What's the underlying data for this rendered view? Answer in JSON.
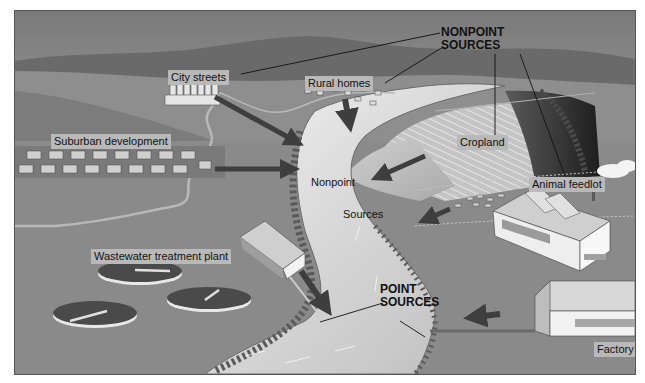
{
  "diagram": {
    "category_labels": {
      "nonpoint_sources": [
        "NONPOINT",
        "SOURCES"
      ],
      "point_sources": [
        "POINT",
        "SOURCES"
      ]
    },
    "source_labels": {
      "city_streets": "City streets",
      "rural_homes": "Rural homes",
      "suburban_development": "Suburban development",
      "cropland": "Cropland",
      "animal_feedlot": "Animal feedlot",
      "wastewater_treatment_plant": "Wastewater treatment plant",
      "factory": "Factory"
    },
    "river_labels": {
      "nonpoint": "Nonpoint",
      "sources": "Sources"
    },
    "colors": {
      "sky_top": "#7d7d7d",
      "sky_bottom": "#c8c8c8",
      "hills": "#6e6e6e",
      "land": "#8c8c8c",
      "river": "#d9d9d9",
      "arrows": "#3e3e3e",
      "label_bg": "#b9b9b9",
      "leader_lines": "#111111"
    }
  }
}
